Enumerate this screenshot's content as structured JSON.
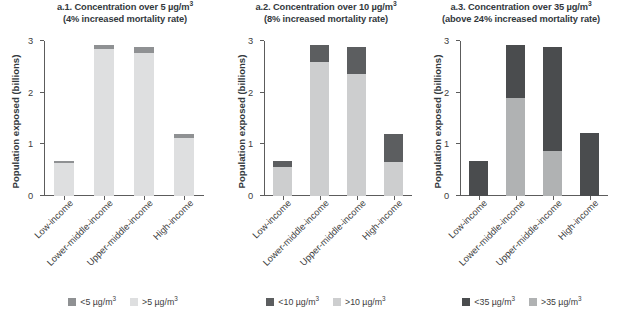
{
  "figure": {
    "y_axis_title": "Population exposed (billions)",
    "y_ticks": [
      "0",
      "1",
      "2",
      "3"
    ],
    "categories": [
      "Low-income",
      "Lower-middle-income",
      "Upper-middle-income",
      "High-income"
    ]
  },
  "panels": [
    {
      "id": "a1",
      "title_line1": "a.1. Concentration over 5 µg/m",
      "title_sup1": "3",
      "title_line2": "(4% increased mortality rate)",
      "legend": [
        {
          "label_pre": "<5 µg/m",
          "label_sup": "3",
          "color": "#8f9193"
        },
        {
          "label_pre": ">5 µg/m",
          "label_sup": "3",
          "color": "#dedfe0"
        }
      ]
    },
    {
      "id": "a2",
      "title_line1": "a.2. Concentration over 10 µg/m",
      "title_sup1": "3",
      "title_line2": "(8% increased mortality rate)",
      "legend": [
        {
          "label_pre": "<10 µg/m",
          "label_sup": "3",
          "color": "#5c5e60"
        },
        {
          "label_pre": ">10 µg/m",
          "label_sup": "3",
          "color": "#cdcecf"
        }
      ]
    },
    {
      "id": "a3",
      "title_line1": "a.3. Concentration over 35 µg/m",
      "title_sup1": "3",
      "title_line2": "(above 24% increased mortality rate)",
      "legend": [
        {
          "label_pre": "<35 µg/m",
          "label_sup": "3",
          "color": "#4a4c4e"
        },
        {
          "label_pre": ">35 µg/m",
          "label_sup": "3",
          "color": "#b0b2b3"
        }
      ]
    }
  ],
  "chart_data": [
    {
      "type": "bar",
      "stacked": true,
      "title": "a.1. Concentration over 5 µg/m3 (4% increased mortality rate)",
      "xlabel": "",
      "ylabel": "Population exposed (billions)",
      "ylim": [
        0,
        3
      ],
      "yticks": [
        0,
        1,
        2,
        3
      ],
      "grid": false,
      "legend_position": "bottom",
      "categories": [
        "Low-income",
        "Lower-middle-income",
        "Upper-middle-income",
        "High-income"
      ],
      "series": [
        {
          "name": "<5 µg/m3",
          "color": "#8f9193",
          "values": [
            0.04,
            0.08,
            0.12,
            0.08
          ]
        },
        {
          "name": ">5 µg/m3",
          "color": "#dedfe0",
          "values": [
            0.63,
            2.85,
            2.77,
            1.13
          ]
        }
      ],
      "totals": [
        0.67,
        2.93,
        2.89,
        1.21
      ]
    },
    {
      "type": "bar",
      "stacked": true,
      "title": "a.2. Concentration over 10 µg/m3 (8% increased mortality rate)",
      "xlabel": "",
      "ylabel": "Population exposed (billions)",
      "ylim": [
        0,
        3
      ],
      "yticks": [
        0,
        1,
        2,
        3
      ],
      "grid": false,
      "legend_position": "bottom",
      "categories": [
        "Low-income",
        "Lower-middle-income",
        "Upper-middle-income",
        "High-income"
      ],
      "series": [
        {
          "name": "<10 µg/m3",
          "color": "#5c5e60",
          "values": [
            0.1,
            0.33,
            0.53,
            0.56
          ]
        },
        {
          "name": ">10 µg/m3",
          "color": "#cdcecf",
          "values": [
            0.57,
            2.6,
            2.36,
            0.65
          ]
        }
      ],
      "totals": [
        0.67,
        2.93,
        2.89,
        1.21
      ]
    },
    {
      "type": "bar",
      "stacked": true,
      "title": "a.3. Concentration over 35 µg/m3 (above 24% increased mortality rate)",
      "xlabel": "",
      "ylabel": "Population exposed (billions)",
      "ylim": [
        0,
        3
      ],
      "yticks": [
        0,
        1,
        2,
        3
      ],
      "grid": false,
      "legend_position": "bottom",
      "categories": [
        "Low-income",
        "Lower-middle-income",
        "Upper-middle-income",
        "High-income"
      ],
      "series": [
        {
          "name": "<35 µg/m3",
          "color": "#4a4c4e",
          "values": [
            0.67,
            1.03,
            2.02,
            1.21
          ]
        },
        {
          "name": ">35 µg/m3",
          "color": "#b0b2b3",
          "values": [
            0.0,
            1.9,
            0.87,
            0.0
          ]
        }
      ],
      "totals": [
        0.67,
        2.93,
        2.89,
        1.21
      ]
    }
  ]
}
